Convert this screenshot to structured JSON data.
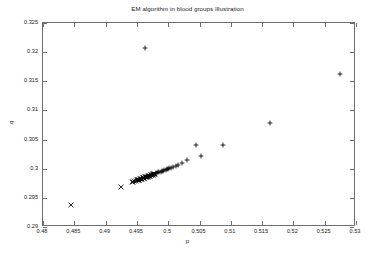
{
  "chart_data": {
    "type": "scatter",
    "title": "EM algorithm in blood groups Illustration",
    "xlabel": "p",
    "ylabel": "q",
    "xlim": [
      0.48,
      0.53
    ],
    "ylim": [
      0.29,
      0.325
    ],
    "xticks": [
      "0.48",
      "0.485",
      "0.49",
      "0.495",
      "0.5",
      "0.505",
      "0.51",
      "0.515",
      "0.52",
      "0.525",
      "0.53"
    ],
    "xtick_values": [
      0.48,
      0.485,
      0.49,
      0.495,
      0.5,
      0.505,
      0.51,
      0.515,
      0.52,
      0.525,
      0.53
    ],
    "yticks": [
      "0.29",
      "0.295",
      "0.3",
      "0.305",
      "0.31",
      "0.315",
      "0.32",
      "0.325"
    ],
    "ytick_values": [
      0.29,
      0.295,
      0.3,
      0.305,
      0.31,
      0.315,
      0.32,
      0.325
    ],
    "grid": false,
    "legend": null,
    "marker_color": "#000000",
    "series": [
      {
        "name": "EM iterates",
        "marker": "mixed",
        "points": [
          {
            "x": 0.49624,
            "y": 0.3207,
            "marker": "plus"
          },
          {
            "x": 0.5275,
            "y": 0.3162,
            "marker": "plus"
          },
          {
            "x": 0.5163,
            "y": 0.3079,
            "marker": "plus"
          },
          {
            "x": 0.5088,
            "y": 0.3041,
            "marker": "plus"
          },
          {
            "x": 0.5045,
            "y": 0.30415,
            "marker": "plus"
          },
          {
            "x": 0.5052,
            "y": 0.30215,
            "marker": "plus"
          },
          {
            "x": 0.503,
            "y": 0.30145,
            "marker": "plus"
          },
          {
            "x": 0.5022,
            "y": 0.30095,
            "marker": "plus"
          },
          {
            "x": 0.5016,
            "y": 0.30065,
            "marker": "plus"
          },
          {
            "x": 0.5012,
            "y": 0.30045,
            "marker": "plus"
          },
          {
            "x": 0.5008,
            "y": 0.3003,
            "marker": "plus"
          },
          {
            "x": 0.5005,
            "y": 0.30018,
            "marker": "plus"
          },
          {
            "x": 0.5002,
            "y": 0.30008,
            "marker": "plus"
          },
          {
            "x": 0.5,
            "y": 0.3,
            "marker": "plus"
          },
          {
            "x": 0.4998,
            "y": 0.29992,
            "marker": "plus"
          },
          {
            "x": 0.4996,
            "y": 0.29984,
            "marker": "plus"
          },
          {
            "x": 0.4994,
            "y": 0.29976,
            "marker": "plus"
          },
          {
            "x": 0.4992,
            "y": 0.29968,
            "marker": "plus"
          },
          {
            "x": 0.499,
            "y": 0.2996,
            "marker": "plus"
          },
          {
            "x": 0.4988,
            "y": 0.29952,
            "marker": "plus"
          },
          {
            "x": 0.4986,
            "y": 0.29944,
            "marker": "plus"
          },
          {
            "x": 0.4984,
            "y": 0.29936,
            "marker": "plus"
          },
          {
            "x": 0.4982,
            "y": 0.29928,
            "marker": "plus"
          },
          {
            "x": 0.498,
            "y": 0.2992,
            "marker": "plus"
          },
          {
            "x": 0.4979,
            "y": 0.29915,
            "marker": "cross"
          },
          {
            "x": 0.4978,
            "y": 0.2991,
            "marker": "cross"
          },
          {
            "x": 0.4977,
            "y": 0.29906,
            "marker": "cross"
          },
          {
            "x": 0.4976,
            "y": 0.29902,
            "marker": "cross"
          },
          {
            "x": 0.4975,
            "y": 0.29898,
            "marker": "cross"
          },
          {
            "x": 0.4974,
            "y": 0.29894,
            "marker": "cross"
          },
          {
            "x": 0.4973,
            "y": 0.2989,
            "marker": "cross"
          },
          {
            "x": 0.4972,
            "y": 0.29886,
            "marker": "cross"
          },
          {
            "x": 0.4971,
            "y": 0.29882,
            "marker": "cross"
          },
          {
            "x": 0.497,
            "y": 0.29878,
            "marker": "cross"
          },
          {
            "x": 0.4969,
            "y": 0.29874,
            "marker": "cross"
          },
          {
            "x": 0.4968,
            "y": 0.2987,
            "marker": "cross"
          },
          {
            "x": 0.4967,
            "y": 0.29866,
            "marker": "cross"
          },
          {
            "x": 0.4966,
            "y": 0.29862,
            "marker": "cross"
          },
          {
            "x": 0.4965,
            "y": 0.29858,
            "marker": "cross"
          },
          {
            "x": 0.4964,
            "y": 0.29854,
            "marker": "cross"
          },
          {
            "x": 0.4963,
            "y": 0.2985,
            "marker": "cross"
          },
          {
            "x": 0.4962,
            "y": 0.29846,
            "marker": "cross"
          },
          {
            "x": 0.4961,
            "y": 0.29842,
            "marker": "cross"
          },
          {
            "x": 0.496,
            "y": 0.29838,
            "marker": "cross"
          },
          {
            "x": 0.4959,
            "y": 0.29834,
            "marker": "cross"
          },
          {
            "x": 0.4958,
            "y": 0.2983,
            "marker": "cross"
          },
          {
            "x": 0.4957,
            "y": 0.29826,
            "marker": "cross"
          },
          {
            "x": 0.4956,
            "y": 0.29822,
            "marker": "cross"
          },
          {
            "x": 0.4955,
            "y": 0.29818,
            "marker": "cross"
          },
          {
            "x": 0.4954,
            "y": 0.29814,
            "marker": "cross"
          },
          {
            "x": 0.4953,
            "y": 0.2981,
            "marker": "cross"
          },
          {
            "x": 0.4952,
            "y": 0.29806,
            "marker": "cross"
          },
          {
            "x": 0.4951,
            "y": 0.29802,
            "marker": "cross"
          },
          {
            "x": 0.495,
            "y": 0.29798,
            "marker": "cross"
          },
          {
            "x": 0.4948,
            "y": 0.2979,
            "marker": "cross"
          },
          {
            "x": 0.4946,
            "y": 0.29782,
            "marker": "cross"
          },
          {
            "x": 0.4944,
            "y": 0.29774,
            "marker": "cross"
          },
          {
            "x": 0.4942,
            "y": 0.29766,
            "marker": "cross"
          },
          {
            "x": 0.4961,
            "y": 0.29845,
            "marker": "cross"
          },
          {
            "x": 0.4925,
            "y": 0.2968,
            "marker": "cross"
          },
          {
            "x": 0.4845,
            "y": 0.29375,
            "marker": "cross"
          }
        ]
      }
    ]
  },
  "figure": {
    "background": "#ffffff",
    "axis_color": "#6d6d6d",
    "text_color": "#1a1a1a"
  }
}
